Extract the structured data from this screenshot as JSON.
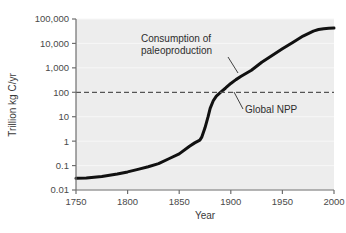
{
  "chart_data": {
    "type": "line",
    "title": "",
    "xlabel": "Year",
    "ylabel": "Trillion kg C/yr",
    "xlim": [
      1750,
      2000
    ],
    "ylim": [
      0.01,
      100000
    ],
    "yscale": "log",
    "grid": true,
    "legend_position": "none",
    "xticks": [
      1750,
      1800,
      1850,
      1900,
      1950,
      2000
    ],
    "xtick_labels": [
      "1750",
      "1800",
      "1850",
      "1900",
      "1950",
      "2000"
    ],
    "yticks": [
      0.01,
      0.1,
      1,
      10,
      100,
      1000,
      10000,
      100000
    ],
    "ytick_labels": [
      "0.01",
      "0.1",
      "1",
      "10",
      "100",
      "1,000",
      "10,000",
      "100,000"
    ],
    "series": [
      {
        "name": "Consumption of paleoproduction",
        "color": "#111111",
        "x": [
          1750,
          1760,
          1775,
          1790,
          1800,
          1810,
          1820,
          1830,
          1840,
          1850,
          1860,
          1865,
          1870,
          1872,
          1875,
          1878,
          1880,
          1883,
          1886,
          1890,
          1895,
          1900,
          1905,
          1910,
          1915,
          1920,
          1930,
          1940,
          1950,
          1960,
          1970,
          1980,
          1985,
          1990,
          1995,
          2000
        ],
        "y": [
          0.03,
          0.031,
          0.036,
          0.045,
          0.055,
          0.07,
          0.09,
          0.12,
          0.19,
          0.3,
          0.62,
          0.85,
          1.1,
          1.5,
          3.5,
          10,
          22,
          45,
          70,
          100,
          150,
          230,
          330,
          450,
          600,
          800,
          1700,
          3200,
          6000,
          11000,
          20000,
          32000,
          37000,
          40000,
          42000,
          43000
        ]
      }
    ],
    "reference_lines": [
      {
        "name": "Global NPP",
        "value": 100,
        "style": "dashed",
        "color": "#555555"
      }
    ],
    "annotations": [
      {
        "name": "consumption-of-paleoproduction",
        "line1": "Consumption of",
        "line2": "paleoproduction"
      },
      {
        "name": "global-npp",
        "line1": "Global NPP"
      }
    ]
  },
  "plot": {
    "background_color": "#ededed",
    "axis_color": "#6e6e6e",
    "gridline_color": "#f7f7f7"
  }
}
